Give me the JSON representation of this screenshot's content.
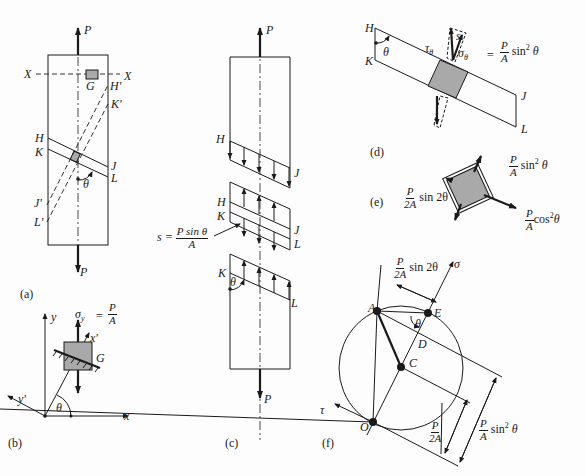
{
  "figure": {
    "panels": {
      "a": {
        "caption": "(a)",
        "labels": {
          "P_top": "P",
          "P_bottom": "P",
          "X_left": "X",
          "X_right": "X",
          "G": "G",
          "H": "H",
          "K": "K",
          "J": "J",
          "L": "L",
          "H_prime": "H'",
          "K_prime": "K'",
          "J_prime": "J'",
          "L_prime": "L'",
          "theta": "θ"
        }
      },
      "b": {
        "caption": "(b)",
        "labels": {
          "y": "y",
          "x": "x",
          "x_prime": "x'",
          "y_prime": "y'",
          "G": "G",
          "theta": "θ",
          "sigma_y": "σ",
          "sigma_y_sub": "y",
          "eq": "=",
          "num": "P",
          "den": "A"
        }
      },
      "c": {
        "caption": "(c)",
        "labels": {
          "P_top": "P",
          "P_bottom": "P",
          "H1": "H",
          "J1": "J",
          "H2": "H",
          "K2": "K",
          "J2": "J",
          "L2": "L",
          "K3": "K",
          "L3": "L",
          "theta": "θ",
          "s_label": "s =",
          "s_num": "P sin θ",
          "s_den": "A"
        }
      },
      "d": {
        "caption": "(d)",
        "labels": {
          "H": "H",
          "K": "K",
          "J": "J",
          "L": "L",
          "theta": "θ",
          "s": "s",
          "tau": "τ",
          "tau_sub": "θ",
          "sigma": "σ",
          "sigma_sub": "θ",
          "eq": "=",
          "num": "P",
          "den": "A",
          "tail": "sin",
          "exp": "2",
          "tail2": "θ"
        }
      },
      "e": {
        "caption": "(e)",
        "labels": {
          "top_num": "P",
          "top_den": "A",
          "top_tail": "sin",
          "top_exp": "2",
          "top_tail2": "θ",
          "left_num": "P",
          "left_den": "2A",
          "left_tail": "sin 2θ",
          "right_num": "P",
          "right_den": "A",
          "right_tail": "cos",
          "right_exp": "2",
          "right_tail2": "θ"
        }
      },
      "f": {
        "caption": "(f)",
        "labels": {
          "A": "A",
          "E": "E",
          "D": "D",
          "C": "C",
          "O": "O",
          "sigma_axis": "σ",
          "tau_axis": "τ",
          "theta": "θ",
          "dim1_num": "P",
          "dim1_den": "2A",
          "dim1_tail": "sin 2θ",
          "dim2_num": "P",
          "dim2_den": "2A",
          "dim3_num": "P",
          "dim3_den": "A",
          "dim3_tail": "sin",
          "dim3_exp": "2",
          "dim3_tail2": "θ"
        }
      }
    },
    "colors": {
      "ink": "#1a1a1a",
      "shade": "#a9a9a9",
      "paper": "#fdfdfd"
    }
  }
}
